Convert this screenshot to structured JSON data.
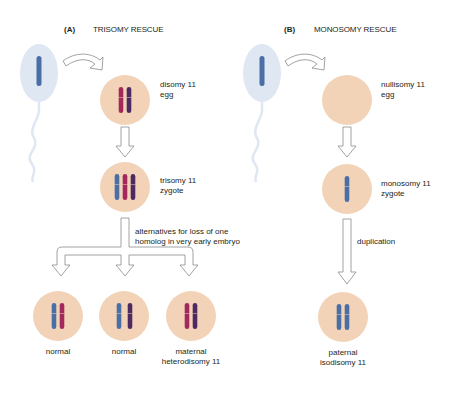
{
  "panels": [
    {
      "letter": "(A)",
      "title": "TRISOMY RESCUE",
      "egg_label": [
        "disomy 11",
        "egg"
      ],
      "zygote_label": [
        "trisomy 11",
        "zygote"
      ],
      "branch_label": [
        "alternatives for loss of one",
        "homolog in very early embryo"
      ],
      "outcomes": [
        {
          "label": [
            "normal"
          ]
        },
        {
          "label": [
            "normal"
          ]
        },
        {
          "label": [
            "maternal",
            "heterodisomy 11"
          ]
        }
      ]
    },
    {
      "letter": "(B)",
      "title": "MONOSOMY RESCUE",
      "egg_label": [
        "nullisomy 11",
        "egg"
      ],
      "zygote_label": [
        "monosomy 11",
        "zygote"
      ],
      "step_label": "duplication",
      "outcome": {
        "label": [
          "paternal",
          "isodisomy 11"
        ]
      }
    }
  ],
  "colors": {
    "cell": "#f2d3b8",
    "sperm": "#dfe7f3",
    "paternal": "#4a6fa5",
    "maternal_1": "#a3285c",
    "maternal_2": "#4e2a63",
    "arrow_stroke": "#8a8a8a"
  }
}
